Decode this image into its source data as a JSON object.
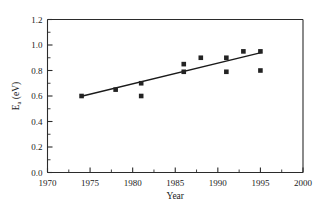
{
  "chart_data": {
    "type": "scatter",
    "title": "",
    "xlabel": "Year",
    "ylabel": "E",
    "ylabel_sub": "a",
    "ylabel_unit": " (eV)",
    "xlim": [
      1970,
      2000
    ],
    "ylim": [
      0.0,
      1.2
    ],
    "x_major_ticks": [
      1970,
      1975,
      1980,
      1985,
      1990,
      1995,
      2000
    ],
    "x_tick_labels": [
      "1970",
      "1975",
      "1980",
      "1985",
      "1990",
      "1995",
      "2000"
    ],
    "x_minor_step": 2.5,
    "y_major_ticks": [
      0.0,
      0.2,
      0.4,
      0.6,
      0.8,
      1.0,
      1.2
    ],
    "y_tick_labels": [
      "0.0",
      "0.2",
      "0.4",
      "0.6",
      "0.8",
      "1.0",
      "1.2"
    ],
    "y_minor_step": 0.1,
    "grid": false,
    "legend": null,
    "marker_shape": "square",
    "marker_color": "#232323",
    "line_color": "#1a1a1a",
    "frame_color": "#2b2b2b",
    "series": [
      {
        "name": "Activation energy measurements",
        "marker": "square",
        "points": [
          {
            "x": 1974,
            "y": 0.6
          },
          {
            "x": 1978,
            "y": 0.65
          },
          {
            "x": 1981,
            "y": 0.7
          },
          {
            "x": 1981,
            "y": 0.6
          },
          {
            "x": 1986,
            "y": 0.85
          },
          {
            "x": 1986,
            "y": 0.79
          },
          {
            "x": 1988,
            "y": 0.9
          },
          {
            "x": 1991,
            "y": 0.9
          },
          {
            "x": 1991,
            "y": 0.79
          },
          {
            "x": 1993,
            "y": 0.95
          },
          {
            "x": 1995,
            "y": 0.95
          },
          {
            "x": 1995,
            "y": 0.8
          }
        ]
      }
    ],
    "trendline": {
      "name": "linear fit",
      "x_start": 1974,
      "y_start": 0.598,
      "x_end": 1995.2,
      "y_end": 0.942
    }
  }
}
